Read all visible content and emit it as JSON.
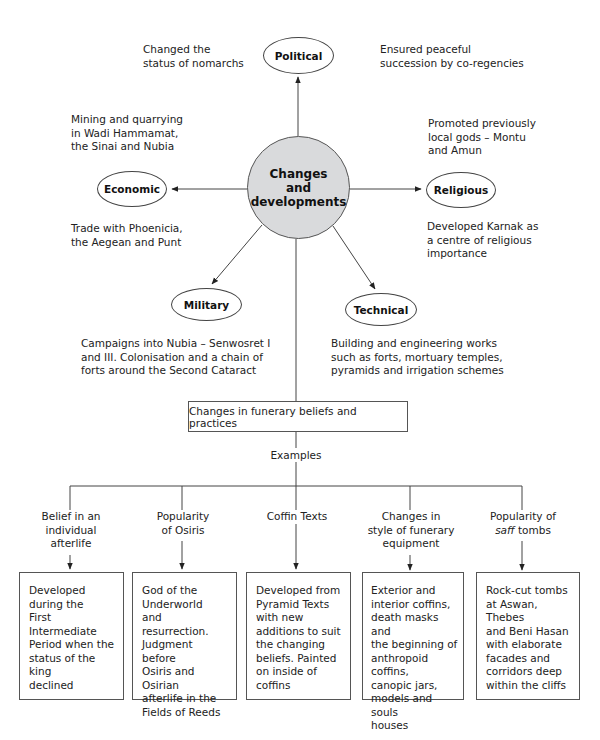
{
  "center": {
    "label": "Changes\nand\ndevelopments",
    "fill": "#d9dadc"
  },
  "nodes": {
    "political": {
      "label": "Political"
    },
    "economic": {
      "label": "Economic"
    },
    "religious": {
      "label": "Religious"
    },
    "military": {
      "label": "Military"
    },
    "technical": {
      "label": "Technical"
    }
  },
  "notes": {
    "political_left": "Changed the\nstatus of nomarchs",
    "political_right": "Ensured peaceful\nsuccession by co-regencies",
    "economic_top": "Mining and quarrying\nin Wadi Hammamat,\nthe Sinai and Nubia",
    "economic_bottom": "Trade with Phoenicia,\nthe Aegean and Punt",
    "religious_top": "Promoted previously\nlocal gods – Montu\nand Amun",
    "religious_bottom": "Developed Karnak as\na centre of religious\nimportance",
    "military": "Campaigns into Nubia – Senwosret I\nand III.  Colonisation and a chain of\nforts around the Second Cataract",
    "technical": "Building and engineering works\nsuch as forts, mortuary temples,\npyramids and irrigation schemes"
  },
  "funerary": {
    "title": "Changes in funerary beliefs and practices",
    "examples_label": "Examples",
    "categories": [
      {
        "label": "Belief in an\nindividual\nafterlife",
        "detail": "Developed\nduring the\nFirst Intermediate\nPeriod when the\nstatus of the king\ndeclined"
      },
      {
        "label": "Popularity\nof Osiris",
        "detail": "God of the\nUnderworld\nand resurrection.\nJudgment before\nOsiris and Osirian\nafterlife in the\nFields of Reeds"
      },
      {
        "label": "Coffin Texts",
        "detail": "Developed from\nPyramid Texts\nwith new\nadditions to suit\nthe changing\nbeliefs. Painted\non inside of\ncoffins"
      },
      {
        "label": "Changes in\nstyle of funerary\nequipment",
        "detail": "Exterior and\ninterior coffins,\ndeath masks and\nthe beginning of\nanthropoid coffins,\ncanopic jars,\nmodels and souls\nhouses"
      },
      {
        "label_pre": "Popularity of\n",
        "label_italic": "saff",
        "label_post": " tombs",
        "detail": "Rock-cut tombs\nat Aswan, Thebes\nand Beni Hasan\nwith elaborate\nfacades and\ncorridors deep\nwithin the cliffs"
      }
    ]
  }
}
